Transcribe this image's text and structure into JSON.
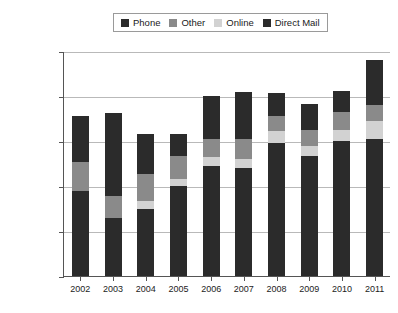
{
  "chart_data": {
    "type": "bar",
    "subtype": "stacked",
    "title": "",
    "xlabel": "",
    "ylabel": "",
    "categories": [
      "2002",
      "2003",
      "2004",
      "2005",
      "2006",
      "2007",
      "2008",
      "2009",
      "2010",
      "2011"
    ],
    "series": [
      {
        "name": "Direct Mail",
        "color": "#2b2b2b",
        "values": [
          95000,
          65000,
          75000,
          100000,
          122000,
          120000,
          148000,
          133000,
          150000,
          152000
        ]
      },
      {
        "name": "Online",
        "color": "#d2d2d2",
        "values": [
          0,
          0,
          8000,
          8000,
          10000,
          10000,
          13000,
          12000,
          12000,
          20000
        ]
      },
      {
        "name": "Other",
        "color": "#8a8a8a",
        "values": [
          32000,
          24000,
          30000,
          25000,
          20000,
          22000,
          17000,
          17000,
          20000,
          18000
        ]
      },
      {
        "name": "Phone",
        "color": "#2b2b2b",
        "values": [
          51000,
          92000,
          45000,
          25000,
          48000,
          52000,
          25000,
          29000,
          24000,
          50000
        ]
      }
    ],
    "totals": [
      178000,
      181000,
      158000,
      158000,
      200000,
      204000,
      203000,
      191000,
      205000,
      240000
    ],
    "yticks": [
      0,
      50000,
      100000,
      150000,
      200000,
      250000
    ],
    "ytick_labels": [
      "0",
      "50,000",
      "100,000",
      "150,000",
      "200,000",
      "250,000"
    ],
    "ylim": [
      0,
      250000
    ],
    "grid": true,
    "legend_position": "top-center",
    "legend": [
      {
        "label": "Phone",
        "color": "#2b2b2b"
      },
      {
        "label": "Other",
        "color": "#8a8a8a"
      },
      {
        "label": "Online",
        "color": "#d2d2d2"
      },
      {
        "label": "Direct Mail",
        "color": "#2b2b2b"
      }
    ]
  }
}
